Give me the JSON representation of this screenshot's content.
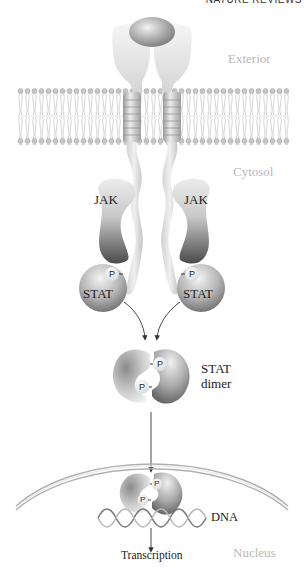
{
  "header": {
    "text": "NATURE REVIEWS"
  },
  "regions": {
    "exterior": "Exterior",
    "cytosol": "Cytosol",
    "nucleus": "Nucleus"
  },
  "proteins": {
    "jak_left": "JAK",
    "jak_right": "JAK",
    "stat_left": "STAT",
    "stat_right": "STAT",
    "stat_dimer_line1": "STAT",
    "stat_dimer_line2": "dimer",
    "phosphate": "P"
  },
  "nucleus": {
    "dna": "DNA",
    "transcription": "Transcription"
  },
  "colors": {
    "background": "#ffffff",
    "region_label": "#b8b8b8",
    "text": "#222222",
    "protein_dark": "#6e6e6e",
    "protein_light": "#e8e8e8",
    "membrane": "#bdbdbd",
    "arrow": "#333333"
  }
}
